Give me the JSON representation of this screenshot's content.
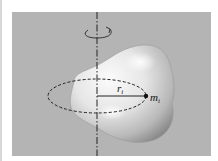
{
  "diagram": {
    "labels": {
      "radius": "r",
      "radius_sub": "i",
      "mass": "m",
      "mass_sub": "i"
    },
    "elements": {
      "axis": "rotation-axis (dash-dot vertical line)",
      "rotation_arrow": "curved arrow indicating rotation",
      "body": "irregular 3D rigid body",
      "orbit": "dashed circular path of mass element",
      "radius_line": "line from axis to mass element",
      "mass_point": "mass element dot"
    },
    "colors": {
      "background": "#ffffff",
      "panel": "#b4b4b4",
      "body_light": "#f4f4f4",
      "body_dark": "#8a8a8a",
      "lines": "#222222"
    }
  }
}
